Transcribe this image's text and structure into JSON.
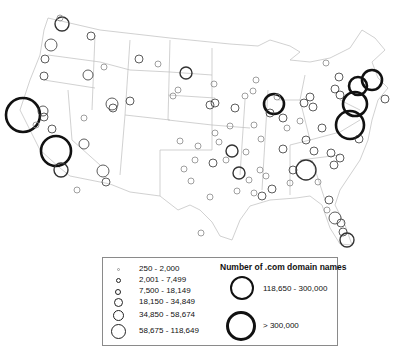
{
  "legend": {
    "title": "Number of .com domain names",
    "classes": [
      {
        "label": "250 - 2,000",
        "size": 3
      },
      {
        "label": "2,001 - 7,499",
        "size": 5
      },
      {
        "label": "7,500 - 18,149",
        "size": 6
      },
      {
        "label": "18,150 - 34,849",
        "size": 9
      },
      {
        "label": "34,850 - 58,674",
        "size": 11
      },
      {
        "label": "58,675 - 118,649",
        "size": 15
      },
      {
        "label": "118,650 - 300,000",
        "size": 24
      },
      {
        "label": "> 300,000",
        "size": 30
      }
    ]
  },
  "map": {
    "subject": "United States (contiguous) .com domain names by city",
    "circles": [
      [
        62,
        24,
        7,
        "m"
      ],
      [
        60,
        18,
        3,
        "s"
      ],
      [
        51,
        45,
        6,
        "s"
      ],
      [
        45,
        59,
        4,
        "s"
      ],
      [
        44,
        76,
        4,
        "s"
      ],
      [
        88,
        75,
        5,
        "s"
      ],
      [
        91,
        36,
        4,
        "s"
      ],
      [
        23,
        115,
        17,
        "l"
      ],
      [
        43,
        111,
        5,
        "s"
      ],
      [
        44,
        117,
        4,
        "s"
      ],
      [
        36,
        125,
        3,
        "s"
      ],
      [
        52,
        129,
        4,
        "s"
      ],
      [
        56,
        151,
        15,
        "l"
      ],
      [
        61,
        170,
        7,
        "m"
      ],
      [
        84,
        144,
        5,
        "s"
      ],
      [
        103,
        171,
        6,
        "s"
      ],
      [
        106,
        182,
        4,
        "s"
      ],
      [
        112,
        104,
        6,
        "s"
      ],
      [
        113,
        108,
        4,
        "s"
      ],
      [
        130,
        101,
        4,
        "s"
      ],
      [
        139,
        59,
        4,
        "s"
      ],
      [
        186,
        73,
        6,
        "m"
      ],
      [
        210,
        105,
        4,
        "s"
      ],
      [
        215,
        103,
        4,
        "s"
      ],
      [
        235,
        108,
        4,
        "s"
      ],
      [
        230,
        126,
        3,
        "s"
      ],
      [
        232,
        151,
        6,
        "m"
      ],
      [
        239,
        173,
        6,
        "m"
      ],
      [
        215,
        133,
        3,
        "s"
      ],
      [
        213,
        163,
        4,
        "s"
      ],
      [
        226,
        160,
        3,
        "s"
      ],
      [
        274,
        104,
        10,
        "l"
      ],
      [
        277,
        97,
        3,
        "s"
      ],
      [
        270,
        113,
        4,
        "s"
      ],
      [
        283,
        118,
        4,
        "s"
      ],
      [
        304,
        103,
        4,
        "s"
      ],
      [
        313,
        107,
        4,
        "s"
      ],
      [
        310,
        97,
        4,
        "s"
      ],
      [
        335,
        89,
        4,
        "s"
      ],
      [
        339,
        77,
        4,
        "s"
      ],
      [
        326,
        63,
        3,
        "s"
      ],
      [
        340,
        95,
        4,
        "s"
      ],
      [
        350,
        125,
        14,
        "l"
      ],
      [
        355,
        104,
        12,
        "l"
      ],
      [
        358,
        86,
        9,
        "l"
      ],
      [
        372,
        80,
        10,
        "l"
      ],
      [
        385,
        99,
        4,
        "s"
      ],
      [
        359,
        139,
        4,
        "s"
      ],
      [
        283,
        149,
        4,
        "s"
      ],
      [
        306,
        140,
        4,
        "s"
      ],
      [
        322,
        128,
        4,
        "s"
      ],
      [
        314,
        151,
        4,
        "s"
      ],
      [
        331,
        153,
        4,
        "s"
      ],
      [
        306,
        170,
        10,
        "m"
      ],
      [
        293,
        170,
        4,
        "s"
      ],
      [
        290,
        183,
        3,
        "s"
      ],
      [
        318,
        182,
        3,
        "s"
      ],
      [
        340,
        158,
        4,
        "s"
      ],
      [
        334,
        165,
        4,
        "s"
      ],
      [
        329,
        200,
        4,
        "s"
      ],
      [
        327,
        210,
        3,
        "s"
      ],
      [
        335,
        218,
        6,
        "s"
      ],
      [
        341,
        223,
        4,
        "s"
      ],
      [
        347,
        240,
        7,
        "m"
      ],
      [
        343,
        232,
        4,
        "s"
      ],
      [
        237,
        191,
        3,
        "s"
      ],
      [
        249,
        180,
        3,
        "s"
      ],
      [
        262,
        196,
        4,
        "s"
      ],
      [
        272,
        189,
        4,
        "s"
      ],
      [
        254,
        193,
        3,
        "s"
      ],
      [
        180,
        141,
        3,
        "s"
      ],
      [
        198,
        146,
        3,
        "s"
      ],
      [
        104,
        67,
        3,
        "s"
      ],
      [
        84,
        118,
        3,
        "s"
      ],
      [
        77,
        190,
        3,
        "s"
      ],
      [
        173,
        96,
        3,
        "s"
      ],
      [
        178,
        90,
        3,
        "s"
      ],
      [
        158,
        64,
        3,
        "s"
      ],
      [
        214,
        84,
        3,
        "s"
      ],
      [
        246,
        152,
        3,
        "s"
      ],
      [
        261,
        139,
        3,
        "s"
      ],
      [
        219,
        142,
        3,
        "s"
      ],
      [
        184,
        169,
        3,
        "s"
      ],
      [
        191,
        181,
        3,
        "s"
      ],
      [
        195,
        160,
        3,
        "s"
      ],
      [
        210,
        197,
        3,
        "s"
      ],
      [
        201,
        233,
        3,
        "s"
      ],
      [
        260,
        170,
        3,
        "s"
      ],
      [
        266,
        176,
        3,
        "s"
      ],
      [
        287,
        128,
        3,
        "s"
      ],
      [
        300,
        121,
        3,
        "s"
      ],
      [
        254,
        125,
        3,
        "s"
      ],
      [
        245,
        96,
        3,
        "s"
      ],
      [
        253,
        91,
        3,
        "s"
      ],
      [
        256,
        80,
        3,
        "s"
      ]
    ]
  }
}
